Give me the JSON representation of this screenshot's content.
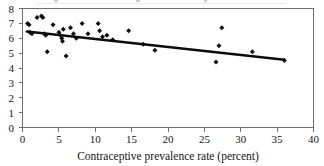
{
  "chart_data": {
    "type": "scatter",
    "title": "",
    "xlabel": "Contraceptive prevalence rate (percent)",
    "ylabel": "",
    "xlim": [
      0,
      40
    ],
    "ylim": [
      0,
      8
    ],
    "xticks": [
      0,
      5,
      10,
      15,
      20,
      25,
      30,
      35,
      40
    ],
    "yticks": [
      0,
      1,
      2,
      3,
      4,
      5,
      6,
      7,
      8
    ],
    "xtick_labels": [
      "0",
      "5",
      "10",
      "15",
      "20",
      "25",
      "30",
      "35",
      "40"
    ],
    "ytick_labels": [
      "0",
      "1",
      "2",
      "3",
      "4",
      "5",
      "6",
      "7",
      "8"
    ],
    "grid": false,
    "legend": null,
    "frame": "box",
    "marker": "diamond",
    "points": [
      {
        "x": 0.7,
        "y": 7.0
      },
      {
        "x": 0.9,
        "y": 6.9
      },
      {
        "x": 1.0,
        "y": 6.4
      },
      {
        "x": 1.3,
        "y": 6.3
      },
      {
        "x": 2.0,
        "y": 7.4
      },
      {
        "x": 2.6,
        "y": 7.5
      },
      {
        "x": 2.8,
        "y": 7.4
      },
      {
        "x": 3.0,
        "y": 6.3
      },
      {
        "x": 3.2,
        "y": 6.2
      },
      {
        "x": 3.4,
        "y": 5.1
      },
      {
        "x": 4.2,
        "y": 6.9
      },
      {
        "x": 5.0,
        "y": 6.4
      },
      {
        "x": 5.2,
        "y": 6.2
      },
      {
        "x": 5.4,
        "y": 6.0
      },
      {
        "x": 5.5,
        "y": 5.8
      },
      {
        "x": 5.6,
        "y": 6.6
      },
      {
        "x": 6.0,
        "y": 4.8
      },
      {
        "x": 6.6,
        "y": 6.7
      },
      {
        "x": 7.0,
        "y": 6.3
      },
      {
        "x": 7.4,
        "y": 6.0
      },
      {
        "x": 8.2,
        "y": 7.0
      },
      {
        "x": 9.0,
        "y": 6.3
      },
      {
        "x": 10.4,
        "y": 7.0
      },
      {
        "x": 10.6,
        "y": 6.5
      },
      {
        "x": 11.0,
        "y": 6.1
      },
      {
        "x": 11.6,
        "y": 6.2
      },
      {
        "x": 12.4,
        "y": 5.9
      },
      {
        "x": 14.6,
        "y": 6.5
      },
      {
        "x": 16.6,
        "y": 5.6
      },
      {
        "x": 18.2,
        "y": 5.2
      },
      {
        "x": 26.6,
        "y": 4.4
      },
      {
        "x": 27.0,
        "y": 5.5
      },
      {
        "x": 27.4,
        "y": 6.7
      },
      {
        "x": 31.6,
        "y": 5.1
      },
      {
        "x": 36.0,
        "y": 4.5
      }
    ],
    "trendline": {
      "type": "linear-fit",
      "x0": 0.6,
      "y0": 6.45,
      "x1": 36.0,
      "y1": 4.55
    }
  },
  "colors": {
    "marker": "#111111",
    "trend": "#0d0d0d",
    "axis": "#6f6f6f",
    "text": "#151515",
    "background": "#ffffff"
  }
}
